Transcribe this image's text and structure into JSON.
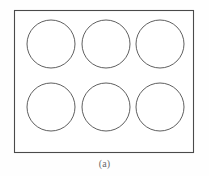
{
  "figure": {
    "caption": "(a)",
    "frame": {
      "name": "outer-rectangle",
      "x": 14,
      "y": 10,
      "width": 179,
      "height": 142,
      "stroke_color": "#4a4a4a",
      "fill_color": "#ffffff"
    },
    "background_color": "#fefefe",
    "circle_stroke_color": "#4d4d4d",
    "circle_fill_color": "#ffffff",
    "grid": {
      "rows": 2,
      "columns": 3,
      "count": 6,
      "radius": 24
    },
    "circles": [
      {
        "label": "circle-row1-col1",
        "cx": 51,
        "cy": 44,
        "r": 24
      },
      {
        "label": "circle-row1-col2",
        "cx": 106,
        "cy": 44,
        "r": 24
      },
      {
        "label": "circle-row1-col3",
        "cx": 160,
        "cy": 44,
        "r": 24
      },
      {
        "label": "circle-row2-col1",
        "cx": 51,
        "cy": 107,
        "r": 24
      },
      {
        "label": "circle-row2-col2",
        "cx": 106,
        "cy": 107,
        "r": 24
      },
      {
        "label": "circle-row2-col3",
        "cx": 160,
        "cy": 107,
        "r": 24
      }
    ]
  }
}
